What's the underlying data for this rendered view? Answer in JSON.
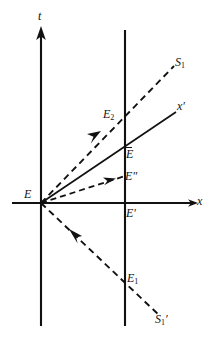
{
  "figure": {
    "type": "minkowski-spacetime-diagram",
    "background_color": "#ffffff",
    "stroke_color": "#111111",
    "width": 214,
    "height": 343
  },
  "axes": {
    "t_axis": {
      "label": "t",
      "orientation": "vertical",
      "arrow": "up"
    },
    "x_axis": {
      "label": "x",
      "orientation": "horizontal",
      "arrow": "right"
    },
    "x_prime_axis": {
      "label_base": "x",
      "label_prime": "′",
      "style": "solid"
    }
  },
  "worldline": {
    "name": "stationary-worldline",
    "style": "solid-vertical"
  },
  "light_signals": [
    {
      "name": "S1",
      "label_base": "S",
      "label_sub": "1",
      "label_prime": "",
      "style": "dashed",
      "direction": "up-right"
    },
    {
      "name": "S1-prime",
      "label_base": "S",
      "label_sub": "1",
      "label_prime": "′",
      "style": "dashed",
      "direction": "down-right"
    }
  ],
  "events": [
    {
      "name": "E",
      "label_base": "E",
      "label_sub": "",
      "label_prime": "",
      "overbar": false
    },
    {
      "name": "E1",
      "label_base": "E",
      "label_sub": "1",
      "label_prime": "",
      "overbar": false
    },
    {
      "name": "E2",
      "label_base": "E",
      "label_sub": "2",
      "label_prime": "",
      "overbar": false
    },
    {
      "name": "E-prime",
      "label_base": "E",
      "label_sub": "",
      "label_prime": "′",
      "overbar": false
    },
    {
      "name": "E-dprime",
      "label_base": "E",
      "label_sub": "",
      "label_prime": "″",
      "overbar": false
    },
    {
      "name": "E-bar",
      "label_base": "E",
      "label_sub": "",
      "label_prime": "",
      "overbar": true
    }
  ],
  "labels": {
    "t": "t",
    "x": "x",
    "x_prime_base": "x",
    "x_prime_mark": "′",
    "S1_base": "S",
    "S1_sub": "1",
    "S1p_base": "S",
    "S1p_sub": "1",
    "S1p_mark": "′",
    "E": "E",
    "E1_base": "E",
    "E1_sub": "1",
    "E2_base": "E",
    "E2_sub": "2",
    "Ebar": "E",
    "Eprime_base": "E",
    "Eprime_mark": "′",
    "Edprime_base": "E",
    "Edprime_mark": "″"
  }
}
